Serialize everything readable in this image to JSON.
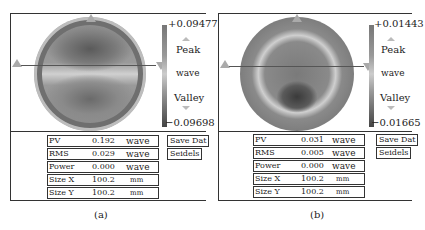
{
  "panels": [
    {
      "id": "a",
      "caption": "(a)",
      "colorbar": {
        "max": "+0.09477",
        "min": "−0.09698",
        "peak": "Peak",
        "unit": "wave",
        "valley": "Valley"
      },
      "stats": [
        {
          "label": "PV",
          "value": "0.192",
          "unit": "wave"
        },
        {
          "label": "RMS",
          "value": "0.029",
          "unit": "wave"
        },
        {
          "label": "Power",
          "value": "0.000",
          "unit": "wave"
        },
        {
          "label": "Size X",
          "value": "100.2",
          "unit": "mm"
        },
        {
          "label": "Size Y",
          "value": "100.2",
          "unit": "mm"
        }
      ],
      "buttons": {
        "save": "Save Dat",
        "seidels": "Seidels"
      }
    },
    {
      "id": "b",
      "caption": "(b)",
      "colorbar": {
        "max": "+0.01443",
        "min": "−0.01665",
        "peak": "Peak",
        "unit": "wave",
        "valley": "Valley"
      },
      "stats": [
        {
          "label": "PV",
          "value": "0.031",
          "unit": "wave"
        },
        {
          "label": "RMS",
          "value": "0.005",
          "unit": "wave"
        },
        {
          "label": "Power",
          "value": "0.000",
          "unit": "wave"
        },
        {
          "label": "Size X",
          "value": "100.2",
          "unit": "mm"
        },
        {
          "label": "Size Y",
          "value": "100.2",
          "unit": "mm"
        }
      ],
      "buttons": {
        "save": "Save Dat",
        "seidels": "Seidels"
      }
    }
  ],
  "colors": {
    "frame": "#333333",
    "marker": "#aaaaaa"
  }
}
